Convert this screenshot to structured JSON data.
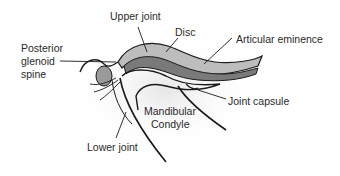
{
  "diagram": {
    "labels": {
      "upper_joint": "Upper joint",
      "disc": "Disc",
      "articular_eminence": "Articular eminence",
      "posterior_glenoid_spine_1": "Posterior",
      "posterior_glenoid_spine_2": "glenoid",
      "posterior_glenoid_spine_3": "spine",
      "joint_capsule": "Joint capsule",
      "mandibular_condyle_1": "Mandibular",
      "mandibular_condyle_2": "Condyle",
      "lower_joint": "Lower joint"
    },
    "colors": {
      "line": "#1a1a1a",
      "shade": "#d8d8d8",
      "background": "#ffffff"
    }
  }
}
